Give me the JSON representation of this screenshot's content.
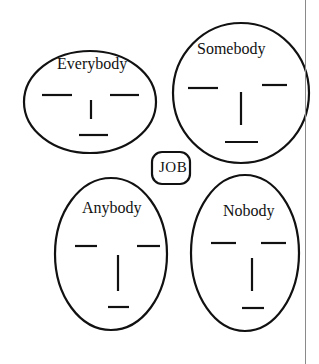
{
  "diagram": {
    "faces": [
      {
        "name": "Everybody",
        "cx": 90,
        "cy": 102,
        "rx": 66,
        "ry": 51
      },
      {
        "name": "Somebody",
        "cx": 241,
        "cy": 93,
        "rx": 68,
        "ry": 70
      },
      {
        "name": "Anybody",
        "cx": 111,
        "cy": 254,
        "rx": 56,
        "ry": 76
      },
      {
        "name": "Nobody",
        "cx": 245,
        "cy": 253,
        "rx": 54,
        "ry": 78
      }
    ],
    "center_box": {
      "label": "JOB"
    },
    "colors": {
      "stroke": "#111111",
      "background": "#ffffff",
      "page_rule": "#8a8a8a"
    }
  }
}
